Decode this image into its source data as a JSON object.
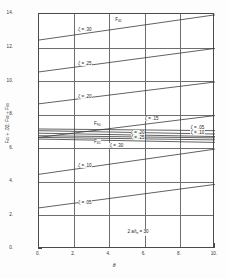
{
  "figure": {
    "caption_note": "2 a/tₑ = 30",
    "background": "#ffffff",
    "line_color": "#3a3a3a",
    "grid_color": "#6e6e6e"
  },
  "chart_data": {
    "type": "line",
    "title": "",
    "xlabel": "θ",
    "ylabel": "F₄₅ + .02;  F₉₀ ÷ F₉₀",
    "xlim": [
      0,
      10
    ],
    "ylim": [
      0,
      14
    ],
    "xticks": [
      "0.",
      "2.",
      "4.",
      "6.",
      "8.",
      "10."
    ],
    "xtick_values": [
      0,
      2,
      4,
      6,
      8,
      10
    ],
    "yticks": [
      "14.",
      "12.",
      "10.",
      "8.",
      "6.",
      "4.",
      "2.",
      "0."
    ],
    "ytick_values": [
      14,
      12,
      10,
      8,
      6,
      4,
      2,
      0
    ],
    "grid": true,
    "legend_position": "inline-annotations",
    "annotations": [
      {
        "text": "F₄₅",
        "x": 4.3,
        "y": 13.65
      },
      {
        "text": "F₉₀",
        "x": 3.1,
        "y": 7.45
      },
      {
        "text": "F₄₅",
        "x": 3.1,
        "y": 6.35
      },
      {
        "text": "2 a/tₑ = 30",
        "x": 5.0,
        "y": 1.0
      }
    ],
    "series": [
      {
        "name": "ζ = .30",
        "family": "F45",
        "label": "ζ = .30",
        "label_x": 2.2,
        "label_y": 13.05,
        "x": [
          0,
          10
        ],
        "values": [
          12.45,
          13.95
        ]
      },
      {
        "name": "ζ = .25",
        "family": "F45",
        "label": "ζ = .25",
        "label_x": 2.2,
        "label_y": 11.05,
        "x": [
          0,
          10
        ],
        "values": [
          10.55,
          11.95
        ]
      },
      {
        "name": "ζ = .20",
        "family": "F45",
        "label": "ζ = .20",
        "label_x": 2.2,
        "label_y": 9.05,
        "x": [
          0,
          10
        ],
        "values": [
          8.65,
          9.95
        ]
      },
      {
        "name": "ζ = .15",
        "family": "F45",
        "label": "ζ = .15",
        "label_x": 6.0,
        "label_y": 7.75,
        "x": [
          0,
          10
        ],
        "values": [
          6.65,
          7.95
        ]
      },
      {
        "name": "ζ = .10",
        "family": "F45",
        "label": "ζ = .10",
        "label_x": 2.2,
        "label_y": 4.95,
        "x": [
          0,
          10
        ],
        "values": [
          4.45,
          5.95
        ]
      },
      {
        "name": "ζ = .05",
        "family": "F45",
        "label": "ζ = .05",
        "label_x": 2.2,
        "label_y": 2.75,
        "x": [
          0,
          10
        ],
        "values": [
          2.45,
          3.85
        ]
      },
      {
        "name": "ζ = .05 (F90 upper)",
        "family": "F90",
        "label": "ζ = .05",
        "label_x": 8.6,
        "label_y": 7.25,
        "x": [
          0,
          10
        ],
        "values": [
          7.15,
          7.05
        ]
      },
      {
        "name": "ζ = .10 (F90)",
        "family": "F90",
        "label": "ζ = .10",
        "label_x": 8.6,
        "label_y": 6.95,
        "x": [
          0,
          10
        ],
        "values": [
          7.05,
          6.85
        ]
      },
      {
        "name": "ζ = .15 (F90)",
        "family": "F90",
        "label": "",
        "label_x": 0,
        "label_y": 0,
        "x": [
          0,
          10
        ],
        "values": [
          6.9,
          6.7
        ]
      },
      {
        "name": "ζ = .20 (F90)",
        "family": "F90",
        "label": "ζ = .20",
        "label_x": 5.2,
        "label_y": 6.95,
        "x": [
          0,
          10
        ],
        "values": [
          6.75,
          6.62
        ]
      },
      {
        "name": "ζ = .25 (F90)",
        "family": "F90",
        "label": "ζ = .25",
        "label_x": 5.2,
        "label_y": 6.62,
        "x": [
          0,
          10
        ],
        "values": [
          6.65,
          6.5
        ]
      },
      {
        "name": "ζ = .30 (F90)",
        "family": "F90",
        "label": "ζ = .30",
        "label_x": 4.0,
        "label_y": 6.15,
        "x": [
          0,
          10
        ],
        "values": [
          6.55,
          6.35
        ]
      }
    ]
  }
}
